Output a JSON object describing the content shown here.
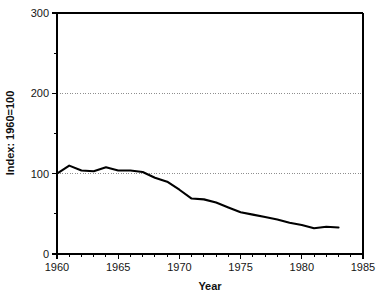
{
  "chart_data": {
    "type": "line",
    "title": "",
    "xlabel": "Year",
    "ylabel": "Index: 1960=100",
    "xlim": [
      1960,
      1985
    ],
    "ylim": [
      0,
      300
    ],
    "grid": "horizontal dotted at 100 and 200",
    "legend": "none",
    "x_ticks_major": [
      1960,
      1965,
      1970,
      1975,
      1980,
      1985
    ],
    "x_tick_labels": [
      "1960",
      "1965",
      "1970",
      "1975",
      "1980",
      "1985"
    ],
    "x_ticks_minor_step": 1,
    "y_ticks_major": [
      0,
      100,
      200,
      300
    ],
    "y_tick_labels": [
      "0",
      "100",
      "200",
      "300"
    ],
    "y_ticks_minor": [
      50,
      150,
      250
    ],
    "gridline_values": [
      100,
      200
    ],
    "series": [
      {
        "name": "Index",
        "x": [
          1960,
          1961,
          1962,
          1963,
          1964,
          1965,
          1966,
          1967,
          1968,
          1969,
          1970,
          1971,
          1972,
          1973,
          1974,
          1975,
          1976,
          1977,
          1978,
          1979,
          1980,
          1981,
          1982,
          1983
        ],
        "values": [
          100,
          110,
          104,
          103,
          108,
          104,
          104,
          102,
          95,
          90,
          80,
          69,
          68,
          64,
          58,
          52,
          49,
          46,
          43,
          39,
          36,
          32,
          34,
          33
        ]
      }
    ],
    "colors": {
      "series_line": "#000000",
      "axis": "#000000",
      "gridline": "#8e8e8e",
      "background": "#ffffff",
      "text": "#151515"
    }
  },
  "geometry": {
    "plot_left": 57,
    "plot_right": 363,
    "plot_top": 13,
    "plot_bottom": 254
  }
}
